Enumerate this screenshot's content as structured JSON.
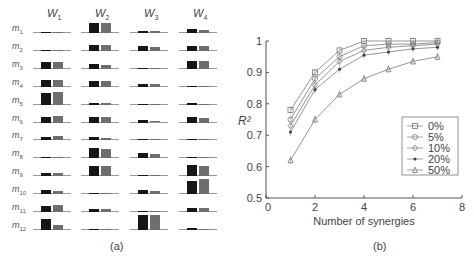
{
  "panel_a": {
    "caption": "(a)",
    "columns": [
      "W1",
      "W2",
      "W3",
      "W4"
    ],
    "column_labels": [
      {
        "base": "W",
        "sub": "1"
      },
      {
        "base": "W",
        "sub": "2"
      },
      {
        "base": "W",
        "sub": "3"
      },
      {
        "base": "W",
        "sub": "4"
      }
    ],
    "rows": [
      {
        "base": "m",
        "sub": "1"
      },
      {
        "base": "m",
        "sub": "2"
      },
      {
        "base": "m",
        "sub": "3"
      },
      {
        "base": "m",
        "sub": "4"
      },
      {
        "base": "m",
        "sub": "5"
      },
      {
        "base": "m",
        "sub": "6"
      },
      {
        "base": "m",
        "sub": "7"
      },
      {
        "base": "m",
        "sub": "8"
      },
      {
        "base": "m",
        "sub": "9"
      },
      {
        "base": "m",
        "sub": "10"
      },
      {
        "base": "m",
        "sub": "11"
      },
      {
        "base": "m",
        "sub": "12"
      }
    ],
    "colors": {
      "dark": "#161616",
      "gray": "#6e6e6e",
      "baseline": "#999999"
    }
  },
  "panel_b": {
    "caption": "(b)"
  },
  "chart_data": [
    {
      "type": "bar",
      "title": "Synergy weights W1-W4 across muscles m1-m12 (two conditions: dark and gray bars)",
      "categories": [
        "m1",
        "m2",
        "m3",
        "m4",
        "m5",
        "m6",
        "m7",
        "m8",
        "m9",
        "m10",
        "m11",
        "m12"
      ],
      "facets": [
        "W1",
        "W2",
        "W3",
        "W4"
      ],
      "series": [
        {
          "name": "dark",
          "facet_values": {
            "W1": [
              0.05,
              0.03,
              0.45,
              0.45,
              0.75,
              0.35,
              0.25,
              0.1,
              0.2,
              0.3,
              0.4,
              0.7
            ],
            "W2": [
              0.65,
              0.4,
              0.3,
              0.4,
              0.08,
              0.4,
              0.2,
              0.7,
              0.7,
              0.03,
              0.2,
              0.02
            ],
            "W3": [
              0.15,
              0.35,
              0.02,
              0.2,
              0.02,
              0.15,
              0.08,
              0.35,
              0.03,
              0.3,
              0.1,
              1.0
            ],
            "W4": [
              0.3,
              0.35,
              0.55,
              0.05,
              0.08,
              0.4,
              0.08,
              0.08,
              0.75,
              0.9,
              0.3,
              0.1
            ]
          }
        },
        {
          "name": "gray",
          "facet_values": {
            "W1": [
              0.0,
              0.0,
              0.45,
              0.45,
              0.85,
              0.45,
              0.3,
              0.05,
              0.2,
              0.2,
              0.45,
              0.35
            ],
            "W2": [
              0.65,
              0.4,
              0.25,
              0.4,
              0.08,
              0.4,
              0.15,
              0.65,
              0.7,
              0.02,
              0.2,
              0.02
            ],
            "W3": [
              0.12,
              0.25,
              0.02,
              0.15,
              0.02,
              0.12,
              0.08,
              0.3,
              0.0,
              0.2,
              0.1,
              1.0
            ],
            "W4": [
              0.2,
              0.3,
              0.5,
              0.0,
              0.05,
              0.3,
              0.05,
              0.02,
              0.7,
              1.0,
              0.25,
              0.03
            ]
          }
        }
      ],
      "xlabel": "",
      "ylabel": "",
      "ylim": [
        0,
        1
      ],
      "grid": false,
      "legend": "none"
    },
    {
      "type": "line",
      "title": "",
      "x": [
        1,
        2,
        3,
        4,
        5,
        6,
        7
      ],
      "xlabel": "Number of synergies",
      "ylabel": "R²",
      "xlim": [
        0,
        8
      ],
      "ylim": [
        0.5,
        1
      ],
      "xticks": [
        0,
        2,
        4,
        6,
        8
      ],
      "yticks": [
        0.5,
        0.6,
        0.7,
        0.8,
        0.9,
        1
      ],
      "ytick_labels": [
        "0.5",
        "0.6",
        "0.7",
        "0.8",
        "0.9",
        "1"
      ],
      "grid": false,
      "legend_position": "lower right",
      "series": [
        {
          "name": "0%",
          "marker": "square",
          "values": [
            0.78,
            0.9,
            0.97,
            1.0,
            1.0,
            1.0,
            1.0
          ]
        },
        {
          "name": "5%",
          "marker": "circle",
          "values": [
            0.75,
            0.88,
            0.95,
            0.985,
            0.99,
            0.99,
            0.995
          ]
        },
        {
          "name": "10%",
          "marker": "diamond",
          "values": [
            0.73,
            0.86,
            0.935,
            0.97,
            0.98,
            0.985,
            0.99
          ]
        },
        {
          "name": "20%",
          "marker": "star",
          "values": [
            0.71,
            0.845,
            0.91,
            0.955,
            0.965,
            0.975,
            0.98
          ]
        },
        {
          "name": "50%",
          "marker": "triangle",
          "values": [
            0.62,
            0.75,
            0.83,
            0.88,
            0.91,
            0.935,
            0.95
          ]
        }
      ]
    }
  ]
}
